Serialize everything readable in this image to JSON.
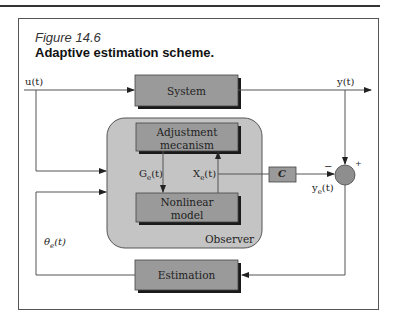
{
  "figure": {
    "number": "Figure 14.6",
    "title": "Adaptive estimation scheme."
  },
  "blocks": {
    "system": "System",
    "adjustment": "Adjustment mecanism",
    "adjustment_line1": "Adjustment",
    "adjustment_line2": "mecanism",
    "nonlinear_line1": "Nonlinear",
    "nonlinear_line2": "model",
    "observer": "Observer",
    "c_gain": "C",
    "estimation": "Estimation"
  },
  "signals": {
    "input": "u(t)",
    "output": "y(t)",
    "ge_main": "G",
    "ge_sub": "e",
    "ge_tail": "(t)",
    "xe_main": "X",
    "xe_sub": "e",
    "xe_tail": "(t)",
    "ye_main": "y",
    "ye_sub": "e",
    "ye_tail": "(t)",
    "theta_main": "θ",
    "theta_sub": "e",
    "theta_tail": "(t)"
  },
  "summing_junction": {
    "minus_sign": "−",
    "plus_sign": "+"
  },
  "colors": {
    "block_fill": "#9a9a9a",
    "observer_fill": "#c4c4c4",
    "shadow": "#1a1a1a",
    "line": "#555555"
  }
}
